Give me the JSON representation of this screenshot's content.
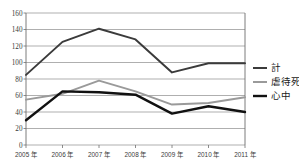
{
  "chart_data": {
    "type": "line",
    "title": "",
    "xlabel": "",
    "ylabel": "",
    "categories": [
      "2005 年",
      "2006 年",
      "2007 年",
      "2008 年",
      "2009 年",
      "2010 年",
      "2011 年"
    ],
    "x": [
      2005,
      2006,
      2007,
      2008,
      2009,
      2010,
      2011
    ],
    "ylim": [
      0,
      160
    ],
    "yticks": [
      0,
      20,
      40,
      60,
      80,
      100,
      120,
      140,
      160
    ],
    "ytick_labels": [
      "0",
      "20",
      "40",
      "60",
      "80",
      "100",
      "120",
      "140",
      "160"
    ],
    "grid": "horizontal",
    "legend_position": "right",
    "series": [
      {
        "name": "計",
        "values": [
          85,
          125,
          141,
          128,
          88,
          99,
          99
        ],
        "color": "#3b3b3b",
        "width": 2.0
      },
      {
        "name": "虐待死",
        "values": [
          55,
          62,
          78,
          65,
          49,
          51,
          58
        ],
        "color": "#9a9a9a",
        "width": 2.0
      },
      {
        "name": "心中",
        "values": [
          30,
          65,
          64,
          61,
          38,
          47,
          40
        ],
        "color": "#111111",
        "width": 2.4
      }
    ]
  },
  "axis": {
    "y_max_label": "160",
    "y_min_label": "0"
  },
  "legend": {
    "items": [
      {
        "label": "計",
        "color": "#3b3b3b"
      },
      {
        "label": "虐待死",
        "color": "#9a9a9a"
      },
      {
        "label": "心中",
        "color": "#111111"
      }
    ]
  },
  "colors": {
    "background": "#ffffff",
    "grid": "#8c8c8c",
    "axis": "#6e6e6e",
    "text": "#3a3a3a",
    "total": "#3b3b3b",
    "abuse": "#9a9a9a",
    "murder_suicide": "#111111"
  }
}
